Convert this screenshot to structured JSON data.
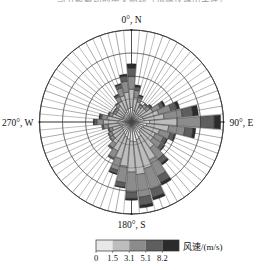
{
  "caption": {
    "text_fragment": "部分被裁切的中文图题（顶端仅露出字底）"
  },
  "chart_data": {
    "type": "bar",
    "subtype": "wind-rose",
    "title": "",
    "xlabel": "",
    "ylabel": "",
    "grid": true,
    "legend_position": "bottom-right",
    "direction_labels": {
      "north": "0°, N",
      "east": "90°, E",
      "south": "180°, S",
      "west": "270°, W"
    },
    "legend": {
      "title": "风速/(m/s)",
      "tick_labels": [
        "0",
        "1.5",
        "3.1",
        "5.1",
        "8.2"
      ],
      "tick_values": [
        0,
        1.5,
        3.1,
        5.1,
        8.2
      ],
      "bin_colors": [
        "#e8e8e8",
        "#bdbdbd",
        "#8c8c8c",
        "#5e5e5e",
        "#2b2b2b"
      ],
      "bin_labels": [
        "0–1.5",
        "1.5–3.1",
        "3.1–5.1",
        "5.1–8.2",
        ">8.2"
      ]
    },
    "radial_rings": [
      0.25,
      0.5,
      0.75,
      1.0
    ],
    "sector_count": 36,
    "sector_width_deg": 10,
    "categories": [
      "0",
      "10",
      "20",
      "30",
      "40",
      "50",
      "60",
      "70",
      "80",
      "90",
      "100",
      "110",
      "120",
      "130",
      "140",
      "150",
      "160",
      "170",
      "180",
      "190",
      "200",
      "210",
      "220",
      "230",
      "240",
      "250",
      "260",
      "270",
      "280",
      "290",
      "300",
      "310",
      "320",
      "330",
      "340",
      "350"
    ],
    "series": [
      {
        "name": "0–1.5",
        "values": [
          0.16,
          0.13,
          0.12,
          0.1,
          0.11,
          0.1,
          0.12,
          0.13,
          0.14,
          0.2,
          0.17,
          0.14,
          0.13,
          0.12,
          0.14,
          0.18,
          0.2,
          0.22,
          0.21,
          0.19,
          0.17,
          0.15,
          0.13,
          0.12,
          0.12,
          0.11,
          0.13,
          0.15,
          0.13,
          0.11,
          0.1,
          0.1,
          0.11,
          0.12,
          0.14,
          0.15
        ]
      },
      {
        "name": "1.5–3.1",
        "values": [
          0.2,
          0.14,
          0.11,
          0.08,
          0.09,
          0.1,
          0.14,
          0.18,
          0.22,
          0.3,
          0.24,
          0.18,
          0.16,
          0.17,
          0.21,
          0.28,
          0.33,
          0.36,
          0.34,
          0.3,
          0.25,
          0.2,
          0.16,
          0.13,
          0.12,
          0.11,
          0.13,
          0.16,
          0.14,
          0.11,
          0.09,
          0.09,
          0.1,
          0.13,
          0.16,
          0.18
        ]
      },
      {
        "name": "3.1–5.1",
        "values": [
          0.14,
          0.08,
          0.05,
          0.03,
          0.04,
          0.05,
          0.09,
          0.14,
          0.2,
          0.26,
          0.18,
          0.12,
          0.1,
          0.11,
          0.15,
          0.2,
          0.24,
          0.25,
          0.22,
          0.18,
          0.13,
          0.09,
          0.06,
          0.04,
          0.04,
          0.04,
          0.05,
          0.07,
          0.06,
          0.04,
          0.03,
          0.03,
          0.04,
          0.06,
          0.09,
          0.12
        ]
      },
      {
        "name": "5.1–8.2",
        "values": [
          0.09,
          0.04,
          0.02,
          0.01,
          0.01,
          0.02,
          0.04,
          0.07,
          0.12,
          0.15,
          0.09,
          0.05,
          0.04,
          0.04,
          0.06,
          0.08,
          0.09,
          0.09,
          0.07,
          0.05,
          0.04,
          0.02,
          0.02,
          0.01,
          0.01,
          0.01,
          0.02,
          0.03,
          0.02,
          0.01,
          0.01,
          0.01,
          0.01,
          0.02,
          0.04,
          0.06
        ]
      },
      {
        "name": ">8.2",
        "values": [
          0.05,
          0.02,
          0.01,
          0.0,
          0.0,
          0.01,
          0.02,
          0.03,
          0.06,
          0.07,
          0.03,
          0.01,
          0.01,
          0.01,
          0.02,
          0.03,
          0.03,
          0.03,
          0.02,
          0.01,
          0.01,
          0.0,
          0.0,
          0.0,
          0.0,
          0.0,
          0.0,
          0.01,
          0.01,
          0.0,
          0.0,
          0.0,
          0.0,
          0.01,
          0.01,
          0.02
        ]
      }
    ]
  }
}
